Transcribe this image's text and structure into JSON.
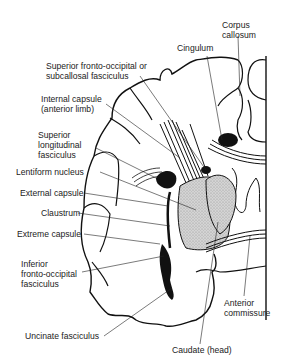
{
  "figure": {
    "labels": [
      {
        "id": "corpus-callosum",
        "lines": [
          "Corpus",
          "callosum"
        ],
        "x": 222,
        "y": 20
      },
      {
        "id": "cingulum",
        "lines": [
          "Cingulum"
        ],
        "x": 177,
        "y": 43
      },
      {
        "id": "superior-fronto-occipital",
        "lines": [
          "Superior fronto-occipital or",
          "subcallosal fasciculus"
        ],
        "x": 46,
        "y": 61
      },
      {
        "id": "internal-capsule",
        "lines": [
          "Internal capsule",
          "(anterior limb)"
        ],
        "x": 41,
        "y": 94
      },
      {
        "id": "superior-longitudinal",
        "lines": [
          "Superior",
          "longitudinal",
          "fasciculus"
        ],
        "x": 38,
        "y": 130
      },
      {
        "id": "lentiform-nucleus",
        "lines": [
          "Lentiform nucleus"
        ],
        "x": 16,
        "y": 169
      },
      {
        "id": "external-capsule",
        "lines": [
          "External capsule"
        ],
        "x": 20,
        "y": 190
      },
      {
        "id": "claustrum",
        "lines": [
          "Claustrum"
        ],
        "x": 41,
        "y": 210
      },
      {
        "id": "extreme-capsule",
        "lines": [
          "Extreme capsule"
        ],
        "x": 17,
        "y": 231
      },
      {
        "id": "inferior-fronto-occipital",
        "lines": [
          "Inferior",
          "fronto-occipital",
          "fasciculus"
        ],
        "x": 21,
        "y": 259
      },
      {
        "id": "anterior-commissure",
        "lines": [
          "Anterior",
          "commissure"
        ],
        "x": 224,
        "y": 300
      },
      {
        "id": "uncinate-fasciculus",
        "lines": [
          "Uncinate fasciculus"
        ],
        "x": 25,
        "y": 333
      },
      {
        "id": "caudate-head",
        "lines": [
          "Caudate (head)"
        ],
        "x": 172,
        "y": 347
      }
    ]
  }
}
